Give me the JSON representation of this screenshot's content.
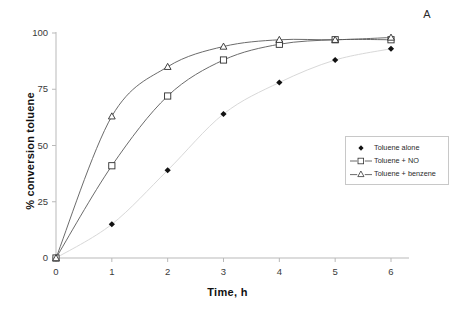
{
  "panel": {
    "label": "A"
  },
  "axes": {
    "x_title": "Time, h",
    "y_title": "% conversion toluene",
    "x_ticks": [
      "0",
      "1",
      "2",
      "3",
      "4",
      "5",
      "6"
    ],
    "y_ticks": [
      "0",
      "25",
      "50",
      "75",
      "100"
    ]
  },
  "legend": {
    "items": [
      {
        "label": "Toluene alone",
        "marker": "filled-diamond-icon"
      },
      {
        "label": "Toluene + NO",
        "marker": "open-square-icon"
      },
      {
        "label": "Toluene + benzene",
        "marker": "open-triangle-icon"
      }
    ]
  },
  "colors": {
    "axis": "#b9b9b9",
    "curve_dark": "#5a5a5a",
    "curve_light": "#d8d8d8",
    "marker_fill": "#111111",
    "text": "#1a1a1a"
  },
  "chart_data": {
    "type": "line",
    "title": "",
    "xlabel": "Time, h",
    "ylabel": "% conversion toluene",
    "xlim": [
      0,
      6
    ],
    "ylim": [
      0,
      100
    ],
    "xticks": [
      0,
      1,
      2,
      3,
      4,
      5,
      6
    ],
    "yticks": [
      0,
      25,
      50,
      75,
      100
    ],
    "grid": false,
    "legend_position": "right-middle",
    "x": [
      0,
      1,
      2,
      3,
      4,
      5,
      6
    ],
    "series": [
      {
        "name": "Toluene alone",
        "marker": "filled-diamond",
        "line": "light-gray",
        "values": [
          0,
          15,
          39,
          64,
          78,
          88,
          93
        ]
      },
      {
        "name": "Toluene + NO",
        "marker": "open-square",
        "line": "dark-gray",
        "values": [
          0,
          41,
          72,
          88,
          95,
          97,
          97
        ]
      },
      {
        "name": "Toluene + benzene",
        "marker": "open-triangle",
        "line": "dark-gray",
        "values": [
          0,
          63,
          85,
          94,
          97,
          97,
          98
        ]
      }
    ]
  }
}
